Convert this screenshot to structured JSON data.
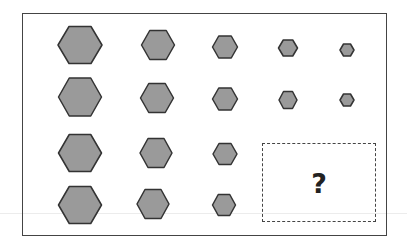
{
  "puzzle": {
    "type": "hexagon-size-matrix",
    "rows": 4,
    "columns": 5,
    "fill_color": "#9a9a9a",
    "stroke_color": "#333333",
    "frame_color": "#444444",
    "cells": [
      {
        "row": 1,
        "col": 1,
        "cx": 80,
        "cy": 45,
        "w": 44,
        "h": 37
      },
      {
        "row": 1,
        "col": 2,
        "cx": 158,
        "cy": 45,
        "w": 33,
        "h": 29
      },
      {
        "row": 1,
        "col": 3,
        "cx": 225,
        "cy": 47,
        "w": 25,
        "h": 22
      },
      {
        "row": 1,
        "col": 4,
        "cx": 288,
        "cy": 48,
        "w": 19,
        "h": 16
      },
      {
        "row": 1,
        "col": 5,
        "cx": 347,
        "cy": 50,
        "w": 14,
        "h": 12
      },
      {
        "row": 2,
        "col": 1,
        "cx": 80,
        "cy": 97,
        "w": 43,
        "h": 38
      },
      {
        "row": 2,
        "col": 2,
        "cx": 157,
        "cy": 98,
        "w": 33,
        "h": 29
      },
      {
        "row": 2,
        "col": 3,
        "cx": 225,
        "cy": 99,
        "w": 25,
        "h": 22
      },
      {
        "row": 2,
        "col": 4,
        "cx": 288,
        "cy": 100,
        "w": 18,
        "h": 17
      },
      {
        "row": 2,
        "col": 5,
        "cx": 347,
        "cy": 100,
        "w": 14,
        "h": 12
      },
      {
        "row": 3,
        "col": 1,
        "cx": 80,
        "cy": 153,
        "w": 43,
        "h": 37
      },
      {
        "row": 3,
        "col": 2,
        "cx": 156,
        "cy": 153,
        "w": 32,
        "h": 29
      },
      {
        "row": 3,
        "col": 3,
        "cx": 225,
        "cy": 154,
        "w": 24,
        "h": 21
      },
      {
        "row": 4,
        "col": 1,
        "cx": 80,
        "cy": 205,
        "w": 43,
        "h": 37
      },
      {
        "row": 4,
        "col": 2,
        "cx": 153,
        "cy": 204,
        "w": 32,
        "h": 29
      },
      {
        "row": 4,
        "col": 3,
        "cx": 224,
        "cy": 205,
        "w": 23,
        "h": 21
      }
    ],
    "missing_cell": {
      "label": "?",
      "rows": [
        3,
        4
      ],
      "cols": [
        4,
        5
      ]
    }
  }
}
